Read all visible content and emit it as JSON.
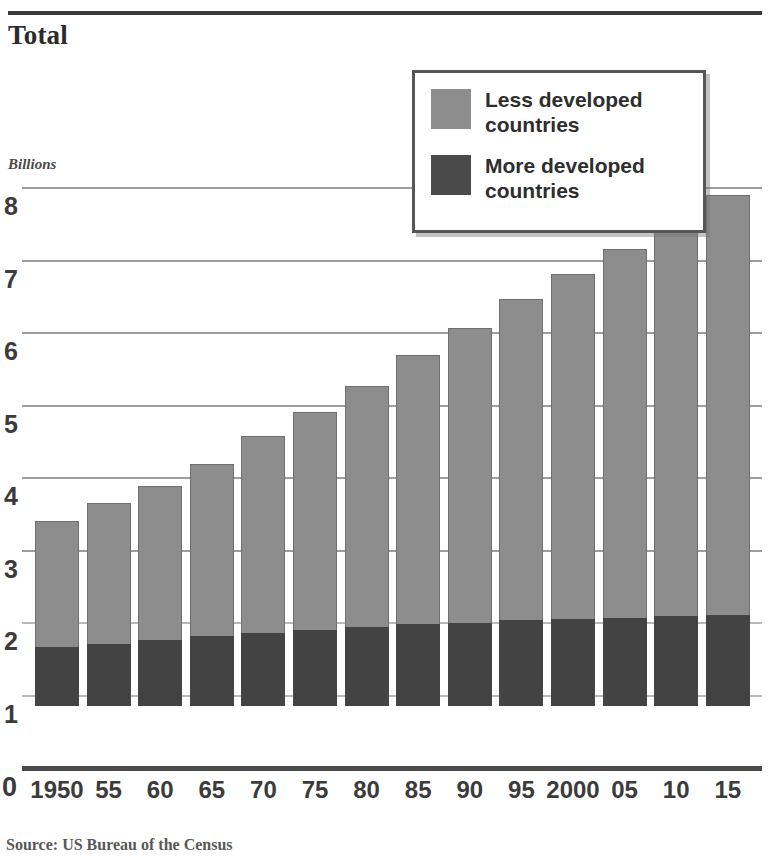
{
  "header": {
    "title": "Total"
  },
  "axes": {
    "y_unit_label": "Billions",
    "y_ticks": [
      "8",
      "7",
      "6",
      "5",
      "4",
      "3",
      "2",
      "1"
    ],
    "y_zero": "0",
    "x_ticks": [
      "1950",
      "55",
      "60",
      "65",
      "70",
      "75",
      "80",
      "85",
      "90",
      "95",
      "2000",
      "05",
      "10",
      "15"
    ]
  },
  "legend": {
    "items": [
      {
        "label": "Less developed countries",
        "color": "#8d8d8d"
      },
      {
        "label": "More developed countries",
        "color": "#4a4a4a"
      }
    ]
  },
  "footer": {
    "source": "Source: US Bureau of the Census"
  },
  "colors": {
    "less_developed": "#8d8d8d",
    "more_developed": "#434343",
    "gridline": "#b9b9b9",
    "axis": "#4a4a4a",
    "text": "#3b3b3b"
  },
  "chart_data": {
    "type": "bar",
    "stacked": true,
    "title": "Total",
    "xlabel": "",
    "ylabel": "Billions",
    "ylim": [
      0,
      8
    ],
    "ytick_values": [
      0,
      1,
      2,
      3,
      4,
      5,
      6,
      7,
      8
    ],
    "grid": true,
    "legend_position": "top-right",
    "categories": [
      "1950",
      "55",
      "60",
      "65",
      "70",
      "75",
      "80",
      "85",
      "90",
      "95",
      "2000",
      "05",
      "10",
      "15"
    ],
    "series": [
      {
        "name": "More developed countries",
        "color": "#434343",
        "values": [
          0.81,
          0.86,
          0.91,
          0.96,
          1.01,
          1.05,
          1.09,
          1.13,
          1.15,
          1.18,
          1.2,
          1.22,
          1.24,
          1.26
        ]
      },
      {
        "name": "Less developed countries",
        "color": "#8d8d8d",
        "values": [
          1.74,
          1.94,
          2.12,
          2.38,
          2.72,
          3.0,
          3.33,
          3.71,
          4.07,
          4.44,
          4.76,
          5.08,
          5.46,
          5.79
        ]
      }
    ],
    "totals": [
      2.55,
      2.8,
      3.03,
      3.34,
      3.73,
      4.05,
      4.42,
      4.84,
      5.22,
      5.62,
      5.96,
      6.3,
      6.7,
      7.05
    ],
    "source": "Source: US Bureau of the Census"
  }
}
